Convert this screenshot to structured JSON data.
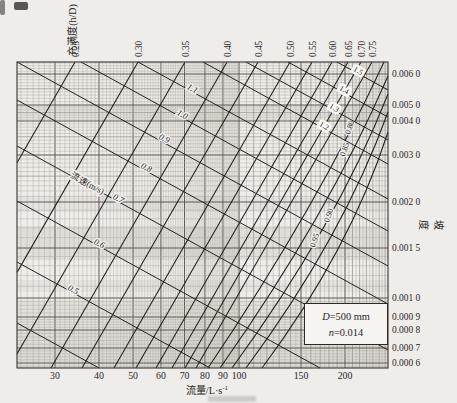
{
  "chart_data": {
    "type": "nomograph",
    "title": "",
    "top_axis": {
      "label": "充满度(h/D)",
      "ticks": [
        "0.25",
        "0.30",
        "0.35",
        "0.40",
        "0.45",
        "0.50",
        "0.55",
        "0.60",
        "0.65",
        "0.70",
        "0.75"
      ]
    },
    "bottom_axis": {
      "label_main": "流量/L·s",
      "label_sup": "-1",
      "scale": "log",
      "ticks": [
        "30",
        "40",
        "50",
        "60",
        "70",
        "80",
        "90",
        "100",
        "150",
        "200"
      ]
    },
    "right_axis": {
      "label": "坡度",
      "scale": "log",
      "ticks": [
        "0.006 0",
        "0.005 0",
        "0.004 0",
        "0.003 0",
        "0.002 0",
        "0.001 5",
        "0.001 0",
        "0.000 9",
        "0.000 8",
        "0.000 7",
        "0.000 6"
      ]
    },
    "velocity_series": {
      "title": "流速(m/s)",
      "labels": [
        "",
        "0.5",
        "0.6",
        "0.7",
        "0.8",
        "0.9",
        "1.0",
        "1.1",
        "1.2",
        "1.3",
        "1.4",
        "1.5"
      ]
    },
    "fullness_inner_labels": [
      "0.80",
      "0.85",
      "0.90",
      "0.95"
    ],
    "legend": {
      "var1": "D",
      "rest1": "=500 mm",
      "var2": "n",
      "rest2": "=0.014"
    },
    "x_range": [
      24,
      265
    ],
    "y_range": [
      0.0006,
      0.0064
    ],
    "grid": "dense log-log"
  }
}
